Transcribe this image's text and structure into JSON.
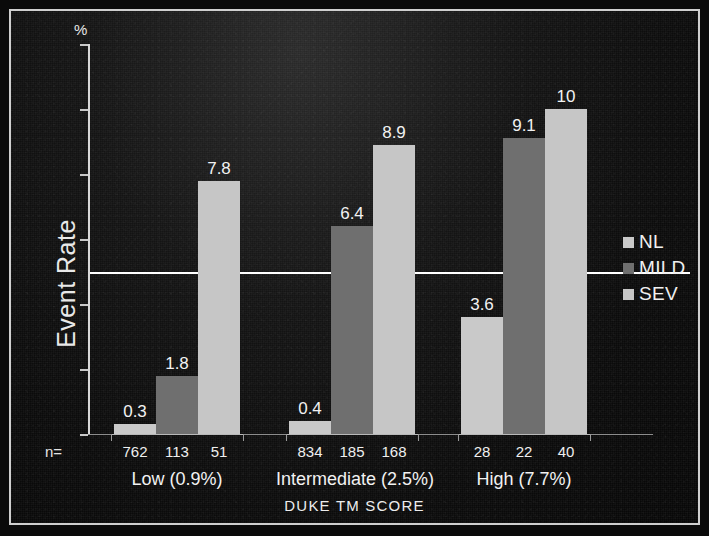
{
  "chart_data": {
    "type": "bar",
    "title": "",
    "xlabel": "DUKE TM SCORE",
    "ylabel": "Event Rate",
    "yunit": "%",
    "ylim": [
      0,
      12
    ],
    "grid": "single horizontal line at 5",
    "legend_position": "right",
    "categories": [
      "Low (0.9%)",
      "Intermediate (2.5%)",
      "High (7.7%)"
    ],
    "series": [
      {
        "name": "NL",
        "values": [
          0.3,
          0.4,
          3.6
        ],
        "color": "#c9c9c9"
      },
      {
        "name": "MILD",
        "values": [
          1.8,
          6.4,
          9.1
        ],
        "color": "#6f6f6f"
      },
      {
        "name": "SEV",
        "values": [
          7.8,
          8.9,
          10
        ],
        "color": "#c6c6c6"
      }
    ],
    "value_labels": [
      [
        "0.3",
        "1.8",
        "7.8"
      ],
      [
        "0.4",
        "6.4",
        "8.9"
      ],
      [
        "3.6",
        "9.1",
        "10"
      ]
    ],
    "n_row_label": "n=",
    "n_values": [
      [
        "762",
        "113",
        "51"
      ],
      [
        "834",
        "185",
        "168"
      ],
      [
        "28",
        "22",
        "40"
      ]
    ]
  },
  "axis": {
    "percent_symbol": "%",
    "y_title": "Event Rate",
    "x_title": "DUKE TM SCORE"
  },
  "legend": {
    "items": [
      {
        "label": "NL",
        "color": "#c9c9c9"
      },
      {
        "label": "MILD",
        "color": "#6f6f6f"
      },
      {
        "label": "SEV",
        "color": "#c6c6c6"
      }
    ]
  },
  "groups": [
    {
      "label": "Low (0.9%)",
      "n_label": "n="
    },
    {
      "label": "Intermediate (2.5%)",
      "n_label": ""
    },
    {
      "label": "High (7.7%)",
      "n_label": ""
    }
  ]
}
